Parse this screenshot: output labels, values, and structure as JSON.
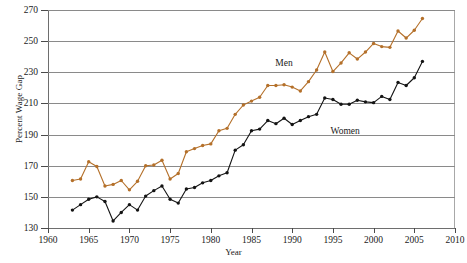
{
  "chart_data": {
    "type": "line",
    "title": "",
    "xlabel": "Year",
    "ylabel": "Percent Wage Gap",
    "xlim": [
      1960,
      2010
    ],
    "ylim": [
      130,
      270
    ],
    "xticks": [
      1960,
      1965,
      1970,
      1975,
      1980,
      1985,
      1990,
      1995,
      2000,
      2005,
      2010
    ],
    "yticks": [
      130,
      150,
      170,
      190,
      210,
      230,
      250,
      270
    ],
    "grid": "horizontal",
    "legend_position": "inline-annotations",
    "markers": true,
    "x": [
      1963,
      1964,
      1965,
      1966,
      1967,
      1968,
      1969,
      1970,
      1971,
      1972,
      1973,
      1974,
      1975,
      1976,
      1977,
      1978,
      1979,
      1980,
      1981,
      1982,
      1983,
      1984,
      1985,
      1986,
      1987,
      1988,
      1989,
      1990,
      1991,
      1992,
      1993,
      1994,
      1995,
      1996,
      1997,
      1998,
      1999,
      2000,
      2001,
      2002,
      2003,
      2004,
      2005,
      2006
    ],
    "series": [
      {
        "name": "Men",
        "color": "#b4702a",
        "values": [
          160.5,
          161.5,
          172.5,
          169.5,
          157.0,
          158.0,
          160.5,
          154.5,
          160.0,
          170.0,
          170.5,
          173.5,
          161.5,
          165.0,
          179.0,
          181.0,
          183.0,
          184.0,
          192.5,
          194.0,
          203.0,
          209.0,
          211.5,
          214.0,
          221.5,
          221.5,
          222.0,
          220.5,
          218.0,
          224.0,
          231.5,
          243.0,
          230.5,
          236.0,
          242.5,
          238.5,
          243.0,
          248.5,
          246.5,
          246.0,
          256.5,
          252.0,
          257.0,
          264.5
        ]
      },
      {
        "name": "Women",
        "color": "#141414",
        "values": [
          141.5,
          145.0,
          148.5,
          150.0,
          147.0,
          134.5,
          140.0,
          145.0,
          141.5,
          150.5,
          154.0,
          157.0,
          148.5,
          146.0,
          155.0,
          156.0,
          159.0,
          160.5,
          163.5,
          165.5,
          180.0,
          183.5,
          192.5,
          193.5,
          199.0,
          197.0,
          200.5,
          196.5,
          199.0,
          201.5,
          203.0,
          213.5,
          212.5,
          209.5,
          209.5,
          212.0,
          211.0,
          210.5,
          214.5,
          212.5,
          223.5,
          221.5,
          226.5,
          237.0
        ]
      }
    ],
    "annotations": [
      {
        "text": "Men",
        "x": 1989,
        "y": 236
      },
      {
        "text": "Women",
        "x": 1996.5,
        "y": 192
      }
    ]
  }
}
